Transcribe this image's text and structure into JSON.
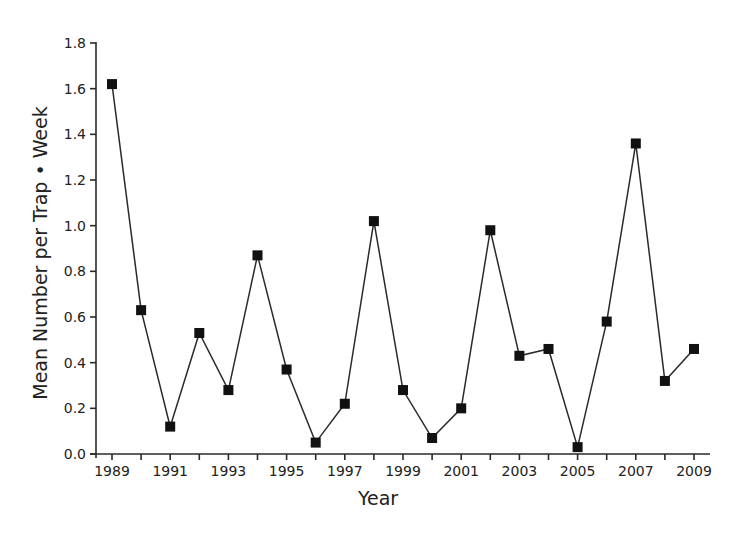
{
  "chart_data": {
    "type": "line",
    "title": "",
    "xlabel": "Year",
    "ylabel": "Mean Number per Trap • Week",
    "x": [
      1989,
      1990,
      1991,
      1992,
      1993,
      1994,
      1995,
      1996,
      1997,
      1998,
      1999,
      2000,
      2001,
      2002,
      2003,
      2004,
      2005,
      2006,
      2007,
      2008,
      2009
    ],
    "series": [
      {
        "name": "Mean Number per Trap • Week",
        "marker": "square",
        "color": "#111111",
        "values": [
          1.62,
          0.63,
          0.12,
          0.53,
          0.28,
          0.87,
          0.37,
          0.05,
          0.22,
          1.02,
          0.28,
          0.07,
          0.2,
          0.98,
          0.43,
          0.46,
          0.03,
          0.58,
          1.36,
          0.32,
          0.46
        ]
      }
    ],
    "ylim": [
      0.0,
      1.8
    ],
    "xlim": [
      1988.5,
      2009.5
    ],
    "yticks": [
      0.0,
      0.2,
      0.4,
      0.6,
      0.8,
      1.0,
      1.2,
      1.4,
      1.6,
      1.8
    ],
    "ytick_labels": [
      "0.0",
      "0.2",
      "0.4",
      "0.6",
      "0.8",
      "1.0",
      "1.2",
      "1.4",
      "1.6",
      "1.8"
    ],
    "xticks_major": [
      1989,
      1991,
      1993,
      1995,
      1997,
      1999,
      2001,
      2003,
      2005,
      2007,
      2009
    ],
    "xtick_labels": [
      "1989",
      "1991",
      "1993",
      "1995",
      "1997",
      "1999",
      "2001",
      "2003",
      "2005",
      "2007",
      "2009"
    ],
    "xticks_minor": [
      1990,
      1992,
      1994,
      1996,
      1998,
      2000,
      2002,
      2004,
      2006,
      2008
    ],
    "grid": false,
    "legend": null
  }
}
